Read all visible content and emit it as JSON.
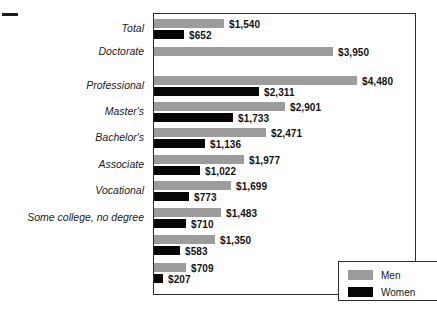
{
  "chart_data": {
    "type": "bar",
    "orientation": "horizontal",
    "title": "",
    "xlabel": "",
    "ylabel": "",
    "grid": false,
    "legend_position": "bottom-right",
    "xlim": [
      0,
      4480
    ],
    "value_prefix": "$",
    "categories": [
      "Total",
      "Doctorate",
      "Professional",
      "Master's",
      "Bachelor's",
      "Associate",
      "Vocational",
      "Some college, no degree",
      "",
      ""
    ],
    "series": [
      {
        "name": "Men",
        "color": "#9c9c9c",
        "values": [
          1540,
          3950,
          4480,
          2901,
          2471,
          1977,
          1699,
          1483,
          1350,
          709
        ],
        "labels": [
          "$1,540",
          "$3,950",
          "$4,480",
          "$2,901",
          "$2,471",
          "$1,977",
          "$1,699",
          "$1,483",
          "$1,350",
          "$709"
        ]
      },
      {
        "name": "Women",
        "color": "#060606",
        "values": [
          652,
          0,
          2311,
          1733,
          1136,
          1022,
          773,
          710,
          583,
          207
        ],
        "labels": [
          "$652",
          "",
          "$2,311",
          "$1,733",
          "$1,136",
          "$1,022",
          "$773",
          "$710",
          "$583",
          "$207"
        ]
      }
    ]
  },
  "legend": {
    "items": [
      {
        "label": "Men",
        "swatch": "men"
      },
      {
        "label": "Women",
        "swatch": "women"
      }
    ]
  }
}
